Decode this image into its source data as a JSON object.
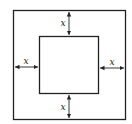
{
  "diagram": {
    "title": "",
    "outer_square": {
      "x": 13,
      "y": 10,
      "w": 113,
      "h": 110
    },
    "inner_square": {
      "x": 39,
      "y": 36,
      "w": 60,
      "h": 58
    },
    "labels": {
      "top": "x",
      "left": "x",
      "right": "x",
      "bottom": "x"
    },
    "colors": {
      "stroke": "#222222",
      "background": "#ffffff"
    }
  }
}
